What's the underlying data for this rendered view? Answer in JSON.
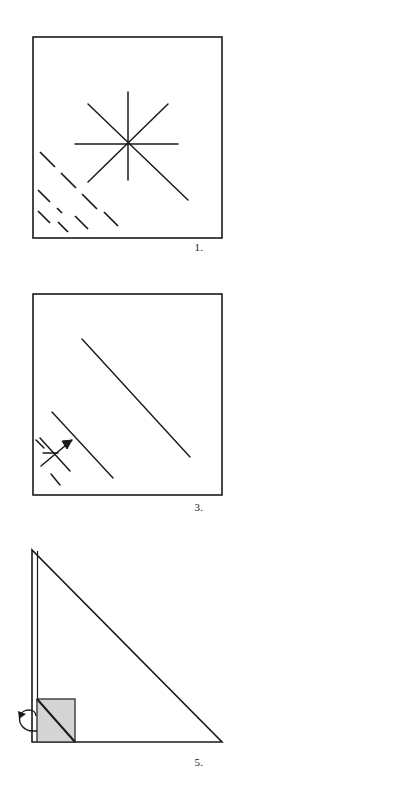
{
  "page": {
    "background_color": "#ffffff",
    "ink_color": "#1a1a1a",
    "shade_color": "#d4d4d4",
    "width": 398,
    "height": 803
  },
  "figures": [
    {
      "id": "figure-1",
      "caption": "1.",
      "shape": "square",
      "square": {
        "x": 33,
        "y": 7,
        "width": 189,
        "height": 201
      },
      "star": {
        "center_x": 128,
        "center_y": 114,
        "rays": [
          {
            "name": "vertical",
            "x1": 128,
            "y1": 62,
            "x2": 128,
            "y2": 150
          },
          {
            "name": "horizontal",
            "x1": 75,
            "y1": 114,
            "x2": 178,
            "y2": 114
          },
          {
            "name": "diagonal-nw-se",
            "x1": 88,
            "y1": 74,
            "x2": 188,
            "y2": 170
          },
          {
            "name": "diagonal-ne-sw",
            "x1": 168,
            "y1": 74,
            "x2": 88,
            "y2": 152
          }
        ]
      },
      "dash_lines": [
        {
          "x1": 40,
          "y1": 122,
          "x2": 55,
          "y2": 137
        },
        {
          "x1": 61,
          "y1": 143,
          "x2": 76,
          "y2": 158
        },
        {
          "x1": 82,
          "y1": 164,
          "x2": 97,
          "y2": 179
        },
        {
          "x1": 38,
          "y1": 160,
          "x2": 50,
          "y2": 172
        },
        {
          "x1": 57,
          "y1": 178,
          "x2": 62,
          "y2": 183
        },
        {
          "x1": 38,
          "y1": 181,
          "x2": 50,
          "y2": 193
        },
        {
          "x1": 58,
          "y1": 192,
          "x2": 68,
          "y2": 202
        },
        {
          "x1": 75,
          "y1": 186,
          "x2": 88,
          "y2": 199
        },
        {
          "x1": 104,
          "y1": 182,
          "x2": 118,
          "y2": 196
        }
      ]
    },
    {
      "id": "figure-3",
      "caption": "3.",
      "shape": "square",
      "square": {
        "x": 33,
        "y": 6,
        "width": 189,
        "height": 201
      },
      "fold_lines": [
        {
          "name": "long-diagonal",
          "x1": 82,
          "y1": 51,
          "x2": 190,
          "y2": 169
        },
        {
          "name": "short-diagonal",
          "x1": 52,
          "y1": 124,
          "x2": 113,
          "y2": 190
        }
      ],
      "corner_mark": {
        "name": "arrow-cross",
        "arrow_tail_x": 41,
        "arrow_tail_y": 178,
        "arrow_head_x": 72,
        "arrow_head_y": 152,
        "cross_lines": [
          {
            "x1": 40,
            "y1": 150,
            "x2": 70,
            "y2": 183
          },
          {
            "x1": 43,
            "y1": 165,
            "x2": 57,
            "y2": 165
          },
          {
            "x1": 52,
            "y1": 186,
            "x2": 60,
            "y2": 196
          }
        ]
      }
    },
    {
      "id": "figure-5",
      "caption": "5.",
      "shape": "right-triangle",
      "triangle": {
        "apex_x": 32,
        "apex_y": 10,
        "bottom_left_x": 32,
        "bottom_left_y": 202,
        "bottom_right_x": 222,
        "bottom_right_y": 202
      },
      "inner_line": {
        "x1": 37,
        "y1": 10,
        "x2": 37,
        "y2": 202
      },
      "shaded_flap": {
        "name": "folded-flap",
        "x": 37,
        "y": 159,
        "width": 38,
        "height": 43,
        "fill": "#d4d4d4",
        "fold_diagonal": {
          "x1": 37,
          "y1": 159,
          "x2": 75,
          "y2": 202
        }
      },
      "curved_arrow": {
        "name": "fold-direction-arrow",
        "x": 12,
        "y": 172,
        "width": 26,
        "height": 26
      }
    }
  ]
}
